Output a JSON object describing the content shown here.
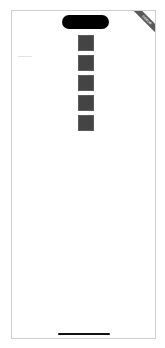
{
  "device": {
    "frame": "phone",
    "dynamic_island": "camera-cutout",
    "home_indicator": "home-bar"
  },
  "debug_banner": {
    "label": "DEBUG",
    "color": "#5a5a5a"
  },
  "content": {
    "squares": [
      {
        "color": "#444444"
      },
      {
        "color": "#444444"
      },
      {
        "color": "#444444"
      },
      {
        "color": "#444444"
      },
      {
        "color": "#444444"
      }
    ]
  },
  "colors": {
    "background": "#ffffff",
    "frame_border": "#cfcfcf",
    "square": "#444444"
  }
}
